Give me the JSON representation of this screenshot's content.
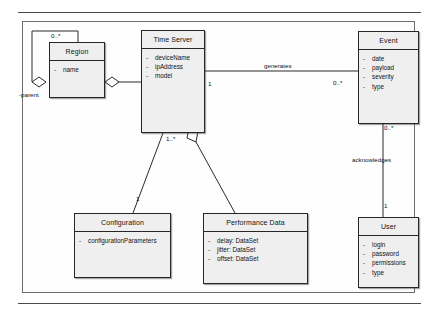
{
  "diagram": {
    "type": "uml-class-diagram",
    "classes": [
      {
        "id": "region",
        "name": "Region",
        "attributes": [
          {
            "visibility": "-",
            "text": "name"
          }
        ]
      },
      {
        "id": "time_server",
        "name": "Time Server",
        "attributes": [
          {
            "visibility": "-",
            "text": "deviceName"
          },
          {
            "visibility": "-",
            "text": "ipAddress"
          },
          {
            "visibility": "-",
            "text": "model"
          }
        ]
      },
      {
        "id": "event",
        "name": "Event",
        "attributes": [
          {
            "visibility": "-",
            "text": "date"
          },
          {
            "visibility": "-",
            "text": "payload"
          },
          {
            "visibility": "-",
            "text": "severity"
          },
          {
            "visibility": "-",
            "text": "type"
          }
        ]
      },
      {
        "id": "configuration",
        "name": "Configuration",
        "attributes": [
          {
            "visibility": "-",
            "text": "configurationParameters"
          }
        ]
      },
      {
        "id": "performance_data",
        "name": "Performance Data",
        "attributes": [
          {
            "visibility": "-",
            "text": "delay:  DataSet"
          },
          {
            "visibility": "-",
            "text": "jitter:  DataSet"
          },
          {
            "visibility": "-",
            "text": "offset:  DataSet"
          }
        ]
      },
      {
        "id": "user",
        "name": "User",
        "attributes": [
          {
            "visibility": "-",
            "text": "login"
          },
          {
            "visibility": "-",
            "text": "password"
          },
          {
            "visibility": "-",
            "text": "permissions"
          },
          {
            "visibility": "-",
            "text": "type"
          }
        ]
      }
    ],
    "relationships": [
      {
        "id": "region_self",
        "from": "region",
        "to": "region",
        "kind": "aggregation",
        "name": "",
        "source_role": "-parent",
        "source_multiplicity": "0..*",
        "target_multiplicity": ""
      },
      {
        "id": "region_timeserver",
        "from": "region",
        "to": "time_server",
        "kind": "aggregation",
        "name": "",
        "source_multiplicity": "",
        "target_multiplicity": ""
      },
      {
        "id": "timeserver_event",
        "from": "time_server",
        "to": "event",
        "kind": "association",
        "name": "generates",
        "source_multiplicity": "1",
        "target_multiplicity": "0..*"
      },
      {
        "id": "timeserver_configuration",
        "from": "time_server",
        "to": "configuration",
        "kind": "association",
        "name": "",
        "source_multiplicity": "1..*",
        "target_multiplicity": "1"
      },
      {
        "id": "timeserver_performance",
        "from": "time_server",
        "to": "performance_data",
        "kind": "aggregation",
        "name": "",
        "source_multiplicity": "",
        "target_multiplicity": ""
      },
      {
        "id": "event_user",
        "from": "event",
        "to": "user",
        "kind": "association",
        "name": "acknowledges",
        "source_multiplicity": "0..*",
        "target_multiplicity": "1"
      }
    ],
    "labels": {
      "parent_role": "-parent",
      "region_self_mult": "0..*",
      "generates": "generates",
      "generates_source_mult": "1",
      "generates_target_mult": "0..*",
      "acknowledges": "acknowledges",
      "acknowledges_source_mult": "0..*",
      "acknowledges_target_mult": "1",
      "config_source_mult": "1..*",
      "config_target_mult": "1"
    }
  }
}
